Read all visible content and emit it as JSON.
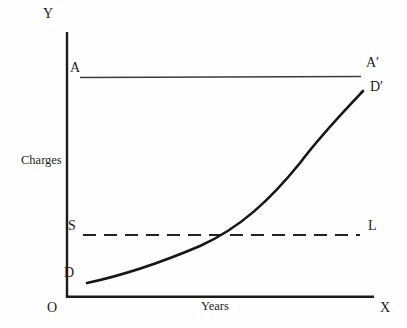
{
  "figure": {
    "title": "",
    "axes": {
      "y_axis_symbol": "Y",
      "x_axis_symbol": "X",
      "origin_label": "O",
      "y_axis_title": "Charges",
      "x_axis_title": "Years"
    },
    "lines": {
      "flat_top_line": {
        "start_label": "A",
        "end_label": "A′",
        "style": "solid-thin"
      },
      "level_dashed_line": {
        "start_label": "S",
        "end_label": "L",
        "style": "dashed"
      },
      "rising_curve": {
        "start_label": "D",
        "end_label": "D′",
        "style": "solid-thick-convex"
      }
    },
    "colors": {
      "ink": "#1c1c1c",
      "thin_line": "#3a3a3a",
      "background": "#fefefe"
    }
  }
}
